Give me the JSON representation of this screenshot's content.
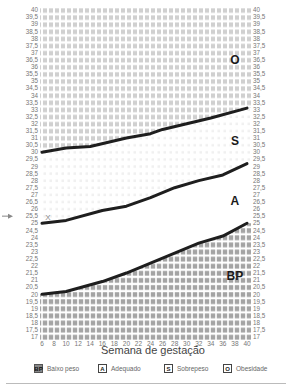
{
  "chart_data": {
    "type": "line",
    "title": "",
    "xlabel": "Semana de gestação",
    "ylabel": "",
    "x_ticks": [
      6,
      8,
      10,
      12,
      14,
      16,
      18,
      20,
      22,
      24,
      26,
      28,
      30,
      32,
      34,
      36,
      38,
      40
    ],
    "y_ticks": [
      "40",
      "39,5",
      "39",
      "38,5",
      "38",
      "37,5",
      "37",
      "36,5",
      "36",
      "35,5",
      "35",
      "34,5",
      "34",
      "33,5",
      "33",
      "32,5",
      "32",
      "31,5",
      "31",
      "30,5",
      "30",
      "29,5",
      "29",
      "28,5",
      "28",
      "27,5",
      "27",
      "26,5",
      "26",
      "25,5",
      "25",
      "24,5",
      "24",
      "23,5",
      "23",
      "22,5",
      "22",
      "21,5",
      "21",
      "20,5",
      "20",
      "19,5",
      "19",
      "18,5",
      "18",
      "17,5",
      "17"
    ],
    "xlim": [
      6,
      40
    ],
    "ylim": [
      17,
      40
    ],
    "grid": true,
    "legend_position": "bottom",
    "series": [
      {
        "name": "Limite Sobrepeso/Obesidade",
        "x": [
          6,
          10,
          14,
          20,
          24,
          26,
          30,
          34,
          40
        ],
        "values": [
          30,
          30.3,
          30.4,
          31,
          31.3,
          31.6,
          32,
          32.4,
          33.1
        ]
      },
      {
        "name": "Limite Adequado/Sobrepeso",
        "x": [
          6,
          10,
          16,
          20,
          24,
          28,
          32,
          36,
          40
        ],
        "values": [
          25,
          25.2,
          25.9,
          26.2,
          26.8,
          27.5,
          28,
          28.4,
          29.2
        ]
      },
      {
        "name": "Limite Baixo peso/Adequado",
        "x": [
          6,
          10,
          16,
          20,
          24,
          28,
          32,
          36,
          40
        ],
        "values": [
          20,
          20.2,
          20.9,
          21.5,
          22.2,
          22.9,
          23.6,
          24.1,
          25
        ]
      }
    ],
    "zones": [
      {
        "code": "O",
        "label": "Obesidade",
        "label_pos": [
          38,
          36.5
        ]
      },
      {
        "code": "S",
        "label": "Sobrepeso",
        "label_pos": [
          38,
          30.8
        ]
      },
      {
        "code": "A",
        "label": "Adequado",
        "label_pos": [
          38,
          26.6
        ]
      },
      {
        "code": "BP",
        "label": "Baixo peso",
        "label_pos": [
          38,
          21.3
        ]
      }
    ],
    "annotations": [
      {
        "type": "arrow-marker",
        "y": 25.5,
        "side": "left"
      },
      {
        "type": "point-marker",
        "symbol": "X",
        "x": 7,
        "y": 25.3
      }
    ]
  },
  "legend": {
    "items": [
      {
        "code": "BP",
        "label": "Baixo peso"
      },
      {
        "code": "A",
        "label": "Adequado"
      },
      {
        "code": "S",
        "label": "Sobrepeso"
      },
      {
        "code": "O",
        "label": "Obesidade"
      }
    ]
  },
  "colors": {
    "line": "#1e1e1e",
    "obesity_fill": "#d2d2d2",
    "underweight_fill": "#a6a6a6",
    "overweight_dots": "#ececec",
    "tick_text": "#777777"
  }
}
